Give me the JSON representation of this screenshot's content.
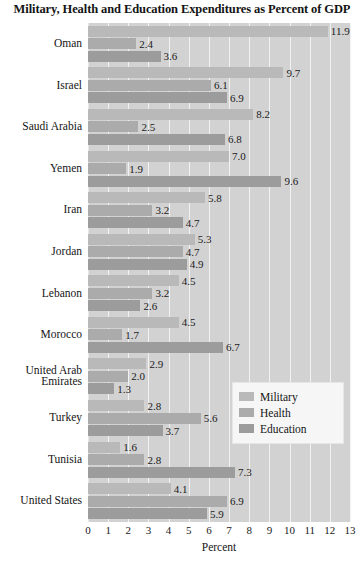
{
  "chart_data": {
    "type": "bar",
    "orientation": "horizontal",
    "title": "Military, Health and Education Expenditures as Percent of GDP",
    "xlabel": "Percent",
    "ylabel": "",
    "xlim": [
      0,
      13
    ],
    "xticks": [
      0,
      1,
      2,
      3,
      4,
      5,
      6,
      7,
      8,
      9,
      10,
      11,
      12,
      13
    ],
    "xtick_labels": [
      "0",
      "1",
      "2",
      "3",
      "4",
      "5",
      "6",
      "7",
      "8",
      "9",
      "10",
      "11",
      "12",
      "13"
    ],
    "grid": "vertical",
    "legend_position": "center-right",
    "categories": [
      "Oman",
      "Israel",
      "Saudi Arabia",
      "Yemen",
      "Iran",
      "Jordan",
      "Lebanon",
      "Morocco",
      "United Arab Emirates",
      "Turkey",
      "Tunisia",
      "United States"
    ],
    "category_label_lines": [
      [
        "Oman"
      ],
      [
        "Israel"
      ],
      [
        "Saudi Arabia"
      ],
      [
        "Yemen"
      ],
      [
        "Iran"
      ],
      [
        "Jordan"
      ],
      [
        "Lebanon"
      ],
      [
        "Morocco"
      ],
      [
        "United Arab",
        "Emirates"
      ],
      [
        "Turkey"
      ],
      [
        "Tunisia"
      ],
      [
        "United States"
      ]
    ],
    "series": [
      {
        "name": "Military",
        "color": "#b9b9b9",
        "values": [
          11.9,
          9.7,
          8.2,
          7.0,
          5.8,
          5.3,
          4.5,
          4.5,
          2.9,
          2.8,
          1.6,
          4.1
        ],
        "labels": [
          "11.9",
          "9.7",
          "8.2",
          "7.0",
          "5.8",
          "5.3",
          "4.5",
          "4.5",
          "2.9",
          "2.8",
          "1.6",
          "4.1"
        ]
      },
      {
        "name": "Health",
        "color": "#ababab",
        "values": [
          2.4,
          6.1,
          2.5,
          1.9,
          3.2,
          4.7,
          3.2,
          1.7,
          2.0,
          5.6,
          2.8,
          6.9
        ],
        "labels": [
          "2.4",
          "6.1",
          "2.5",
          "1.9",
          "3.2",
          "4.7",
          "3.2",
          "1.7",
          "2.0",
          "5.6",
          "2.8",
          "6.9"
        ]
      },
      {
        "name": "Education",
        "color": "#9c9c9c",
        "values": [
          3.6,
          6.9,
          6.8,
          9.6,
          4.7,
          4.9,
          2.6,
          6.7,
          1.3,
          3.7,
          7.3,
          5.9
        ],
        "labels": [
          "3.6",
          "6.9",
          "6.8",
          "9.6",
          "4.7",
          "4.9",
          "2.6",
          "6.7",
          "1.3",
          "3.7",
          "7.3",
          "5.9"
        ]
      }
    ],
    "legend": [
      {
        "label": "Military",
        "color": "#b9b9b9"
      },
      {
        "label": "Health",
        "color": "#ababab"
      },
      {
        "label": "Education",
        "color": "#9c9c9c"
      }
    ]
  }
}
